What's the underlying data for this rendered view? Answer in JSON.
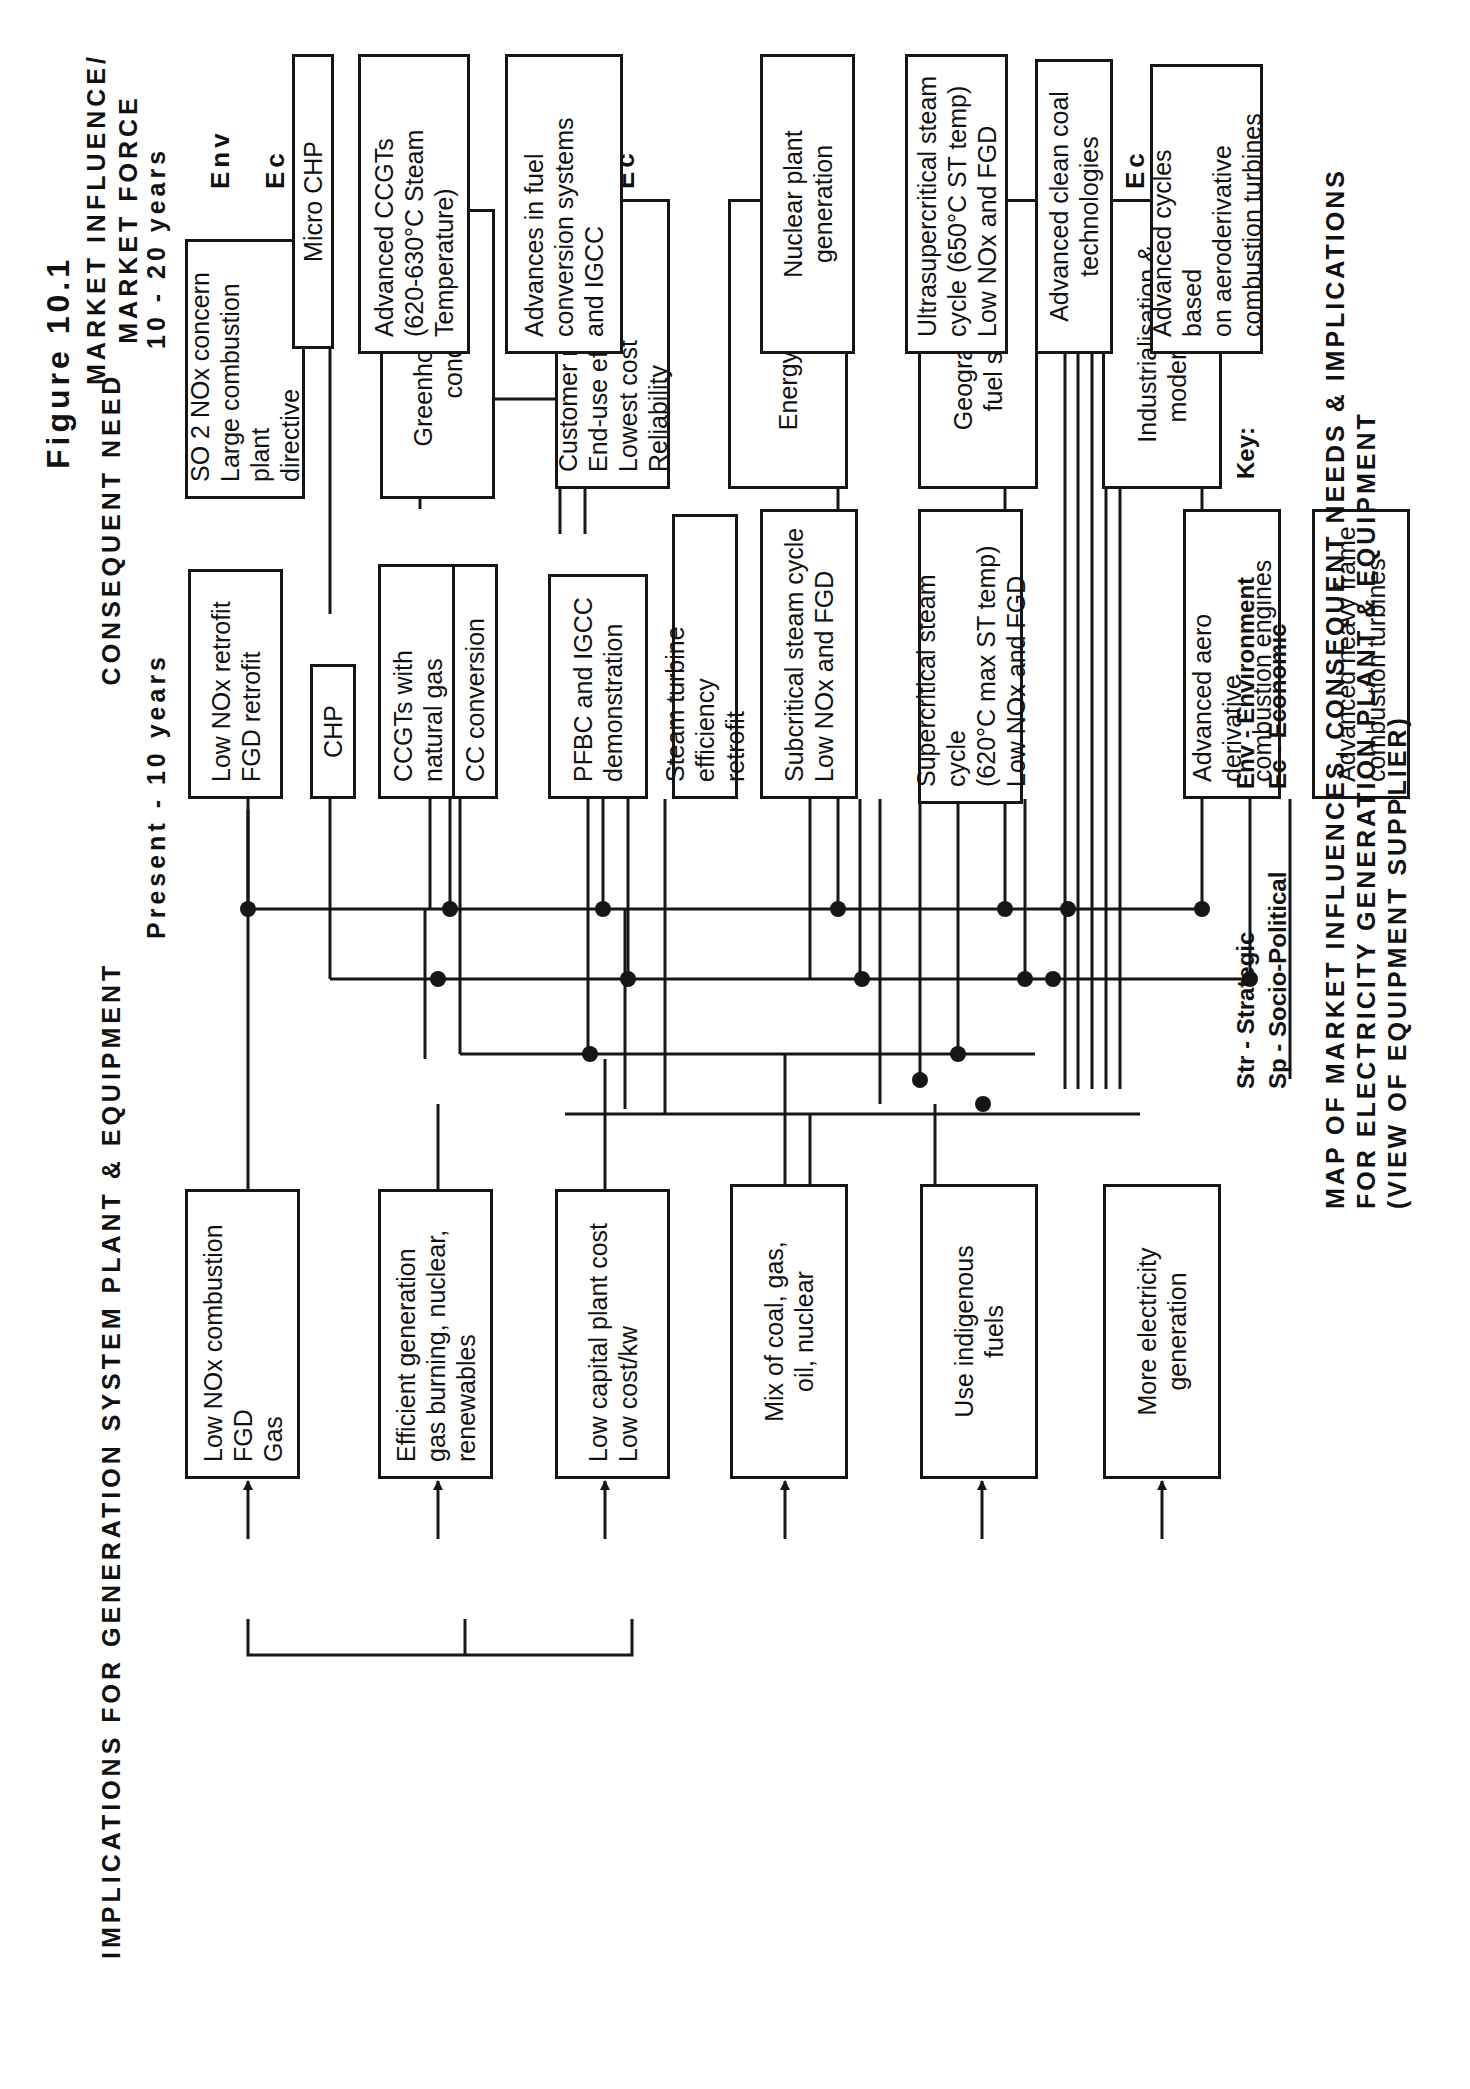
{
  "figure": {
    "label": "Figure  10.1"
  },
  "headers": {
    "market": "MARKET  INFLUENCE/\nMARKET  FORCE",
    "need": "CONSEQUENT  NEED",
    "implications": "IMPLICATIONS  FOR  GENERATION  SYSTEM  PLANT  &  EQUIPMENT",
    "near_term": "Present  -  10  years",
    "long_term": "10  -  20  years"
  },
  "market_forces": [
    {
      "text": "SO 2  NOx  concern\nLarge combustion plant\ndirective",
      "tags": [
        "Env",
        "Ec"
      ]
    },
    {
      "text": "Greenhouse gas\nconcern",
      "tags": [
        "Env"
      ]
    },
    {
      "text": "Customer needs:\nEnd-use efficiency\nLowest cost\nReliability",
      "tags": [
        "Ec"
      ]
    },
    {
      "text": "Energy security",
      "tags": [
        "Str"
      ]
    },
    {
      "text": "Geography and\nfuel sources",
      "tags": [
        "Str"
      ]
    },
    {
      "text": "Industrialisation &\nmodernisation",
      "tags": [
        "Ec",
        "Sp"
      ]
    }
  ],
  "needs": [
    {
      "text": "Low NOx  combustion\nFGD\nGas"
    },
    {
      "text": "Efficient generation\ngas burning, nuclear,\nrenewables"
    },
    {
      "text": "Low capital plant cost\nLow cost/kw"
    },
    {
      "text": "Mix of coal, gas,\noil, nuclear"
    },
    {
      "text": "Use indigenous\nfuels"
    },
    {
      "text": "More electricity\ngeneration"
    }
  ],
  "near_term_items": [
    {
      "text": "Low NOx retrofit\nFGD retrofit"
    },
    {
      "text": "CHP"
    },
    {
      "text": "CCGTs with\nnatural gas"
    },
    {
      "text": "CC conversion"
    },
    {
      "text": "PFBC and IGCC\ndemonstration"
    },
    {
      "text": "Steam turbine efficiency\nretrofit"
    },
    {
      "text": "Subcritical steam cycle\nLow NOx and FGD"
    },
    {
      "text": "Supercritical steam cycle\n(620°C max ST temp)\nLow NOx and FGD"
    },
    {
      "text": "Advanced aero derivative\ncombustion engines"
    },
    {
      "text": "Advanced heavy frame\ncombustion turbines"
    }
  ],
  "long_term_items": [
    {
      "text": "Micro CHP"
    },
    {
      "text": "Advanced CCGTs\n(620-630°C Steam\nTemperature)"
    },
    {
      "text": "Advances in fuel\nconversion systems\nand IGCC"
    },
    {
      "text": "Nuclear plant\ngeneration"
    },
    {
      "text": "Ultrasupercritical steam\ncycle (650°C ST temp)\nLow NOx and FGD"
    },
    {
      "text": "Advanced clean coal\ntechnologies"
    },
    {
      "text": "Advanced cycles based\non aeroderivative\ncombustion turbines"
    }
  ],
  "key": {
    "label": "Key:",
    "entries": [
      {
        "abbr": "Env",
        "sep": "-",
        "meaning": "Environment"
      },
      {
        "abbr": "Ec",
        "sep": "-",
        "meaning": "Economic"
      },
      {
        "abbr": "Str",
        "sep": "-",
        "meaning": "Strategic"
      },
      {
        "abbr": "Sp",
        "sep": "-",
        "meaning": "Socio-Political"
      }
    ]
  },
  "caption": "MAP  OF  MARKET  INFLUENCES,  CONSEQUENT  NEEDS  &  IMPLICATIONS\nFOR  ELECTRICITY  GENERATION  PLANT  &  EQUIPMENT\n(VIEW  OF  EQUIPMENT  SUPPLIER)",
  "colors": {
    "ink": "#161616",
    "paper": "#ffffff"
  }
}
